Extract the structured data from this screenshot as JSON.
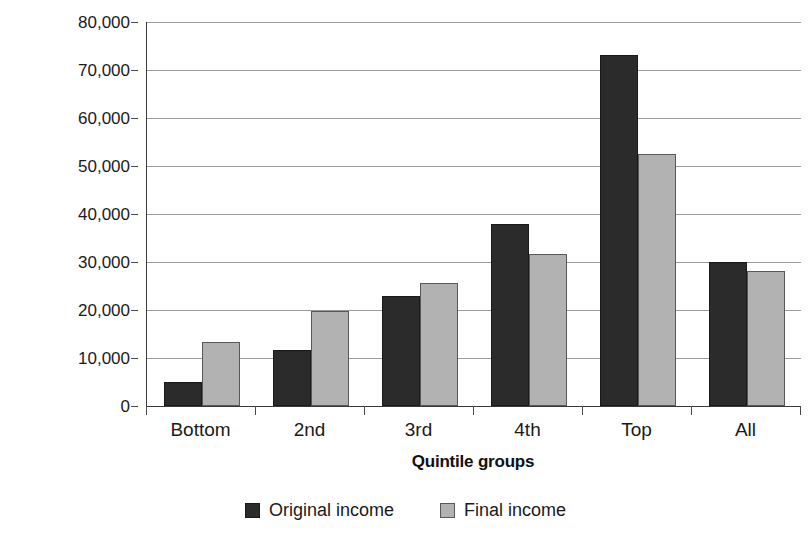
{
  "chart_data": {
    "type": "bar",
    "title": "",
    "subtitle": "",
    "xlabel": "Quintile groups",
    "ylabel": "£ per year",
    "categories": [
      "Bottom",
      "2nd",
      "3rd",
      "4th",
      "Top",
      "All"
    ],
    "series": [
      {
        "name": "Original income",
        "color": "#2b2b2b",
        "values": [
          5000,
          11700,
          22900,
          38000,
          73100,
          29900
        ]
      },
      {
        "name": "Final income",
        "color": "#b2b2b2",
        "values": [
          13400,
          19800,
          25600,
          31700,
          52400,
          28100
        ]
      }
    ],
    "ylim": [
      0,
      80000
    ],
    "ytick_values": [
      0,
      10000,
      20000,
      30000,
      40000,
      50000,
      60000,
      70000,
      80000
    ],
    "ytick_labels": [
      "0",
      "10,000",
      "20,000",
      "30,000",
      "40,000",
      "50,000",
      "60,000",
      "70,000",
      "80,000"
    ],
    "grid": "horizontal",
    "legend_position": "bottom-center",
    "bar_orientation": "vertical",
    "grouping": "clustered"
  },
  "axes": {
    "y_title": "£ per year",
    "x_title": "Quintile groups"
  },
  "legend": {
    "entries": [
      {
        "label": "Original income",
        "swatch": "dark-swatch"
      },
      {
        "label": "Final income",
        "swatch": "light-swatch"
      }
    ]
  }
}
